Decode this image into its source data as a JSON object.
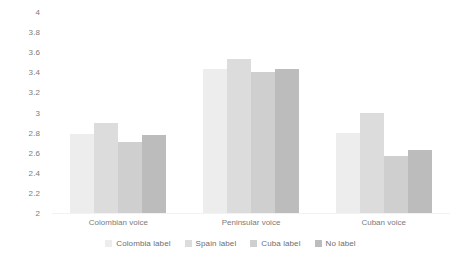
{
  "chart_data": {
    "type": "bar",
    "title": "",
    "subtitle": "",
    "xlabel": "",
    "ylabel": "",
    "ylim": [
      2,
      4
    ],
    "ytick_step": 0.2,
    "yticks": [
      "4",
      "3.8",
      "3.6",
      "3.4",
      "3.2",
      "3",
      "2.8",
      "2.6",
      "2.4",
      "2.2",
      "2"
    ],
    "grid": false,
    "legend_position": "bottom",
    "categories": [
      "Colombian voice",
      "Peninsular voice",
      "Cuban voice"
    ],
    "series": [
      {
        "name": "Colombia label",
        "color": "#ededed",
        "values": [
          2.79,
          3.43,
          2.8
        ]
      },
      {
        "name": "Spain label",
        "color": "#dcdcdc",
        "values": [
          2.9,
          3.53,
          3.0
        ]
      },
      {
        "name": "Cuba label",
        "color": "#cfcfcf",
        "values": [
          2.71,
          3.4,
          2.57
        ]
      },
      {
        "name": "No label",
        "color": "#bcbcbc",
        "values": [
          2.78,
          3.43,
          2.63
        ]
      }
    ]
  },
  "colors": {
    "background": "#ffffff",
    "axis_text": "#7b7b7b",
    "legend_text": "#6e6e6e",
    "baseline": "#f2f2f2"
  }
}
